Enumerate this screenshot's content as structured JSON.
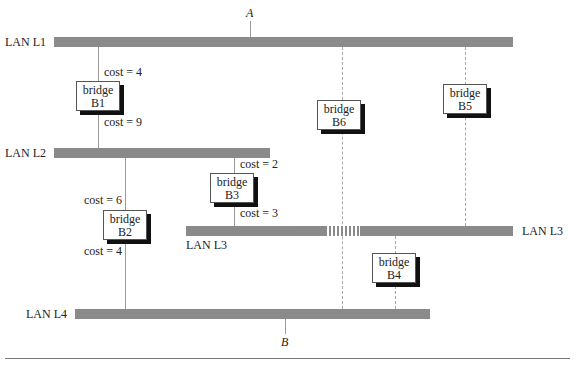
{
  "diagram": {
    "endpoints": {
      "a": "A",
      "b": "B"
    },
    "lans": {
      "l1": {
        "label": "LAN L1"
      },
      "l2": {
        "label": "LAN L2"
      },
      "l3": {
        "label": "LAN L3",
        "label_right": "LAN L3"
      },
      "l4": {
        "label": "LAN L4"
      }
    },
    "bridges": {
      "b1": {
        "line1": "bridge",
        "line2": "B1"
      },
      "b2": {
        "line1": "bridge",
        "line2": "B2"
      },
      "b3": {
        "line1": "bridge",
        "line2": "B3"
      },
      "b4": {
        "line1": "bridge",
        "line2": "B4"
      },
      "b5": {
        "line1": "bridge",
        "line2": "B5"
      },
      "b6": {
        "line1": "bridge",
        "line2": "B6"
      }
    },
    "costs": {
      "b1_l1": "cost = 4",
      "b1_l2": "cost = 9",
      "b2_l2": "cost = 6",
      "b2_l4": "cost = 4",
      "b3_l2": "cost = 2",
      "b3_l3": "cost = 3"
    },
    "colors": {
      "lan": "#8a8a8a",
      "shadow": "#111111",
      "link": "#9a9a9a"
    }
  }
}
